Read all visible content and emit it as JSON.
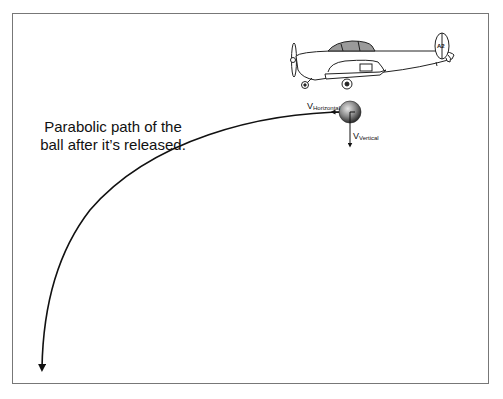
{
  "diagram": {
    "caption_line1": "Parabolic path of the",
    "caption_line2": "ball after it’s released.",
    "v_horizontal": {
      "symbol": "V",
      "subscript": "Horizontal"
    },
    "v_vertical": {
      "symbol": "V",
      "subscript": "Vertical"
    },
    "aircraft_tail_number": "A2",
    "colors": {
      "line": "#111111",
      "frame": "#777777",
      "ball_light": "#d9d9d9",
      "ball_dark": "#3a3a3a",
      "canopy": "#9a9a9a"
    }
  }
}
